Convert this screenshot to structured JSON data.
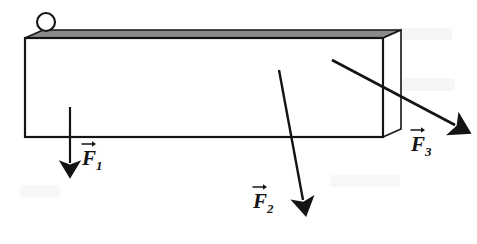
{
  "figure": {
    "type": "free-body-force-diagram",
    "background_color": "#ffffff",
    "ink_color": "#141414",
    "top_face_color": "#8a8a8a",
    "front_face_color": "#ffffff",
    "title": ""
  },
  "body": {
    "name": "rectangular-beam",
    "front_face": {
      "x": 25,
      "y": 38,
      "width": 358,
      "height": 99
    },
    "top_face_points": "25,38 43,30 401,30 383,38",
    "right_face_points": "383,38 401,30 401,129 383,137"
  },
  "ball": {
    "name": "roller-ball",
    "cx": 46,
    "cy": 22,
    "r": 9,
    "fill": "#ffffff"
  },
  "vectors": [
    {
      "id": "F1",
      "label": "F",
      "subscript": "1",
      "x1": 70,
      "y1": 107,
      "x2": 70,
      "y2": 163,
      "direction": "down"
    },
    {
      "id": "F2",
      "label": "F",
      "subscript": "2",
      "x1": 279,
      "y1": 70,
      "x2": 303,
      "y2": 200,
      "direction": "down-right-steep"
    },
    {
      "id": "F3",
      "label": "F",
      "subscript": "3",
      "x1": 332,
      "y1": 60,
      "x2": 455,
      "y2": 125,
      "direction": "down-right-shallow"
    }
  ],
  "artifacts": [
    {
      "x": 110,
      "y": 62,
      "width": 120,
      "height": 16,
      "opacity": 0.07
    },
    {
      "x": 140,
      "y": 88,
      "width": 95,
      "height": 13,
      "opacity": 0.06
    },
    {
      "x": 255,
      "y": 95,
      "width": 110,
      "height": 14,
      "opacity": 0.06
    },
    {
      "x": 392,
      "y": 28,
      "width": 60,
      "height": 12,
      "opacity": 0.06
    },
    {
      "x": 400,
      "y": 78,
      "width": 55,
      "height": 13,
      "opacity": 0.06
    },
    {
      "x": 20,
      "y": 185,
      "width": 40,
      "height": 12,
      "opacity": 0.05
    },
    {
      "x": 330,
      "y": 175,
      "width": 70,
      "height": 12,
      "opacity": 0.05
    }
  ]
}
